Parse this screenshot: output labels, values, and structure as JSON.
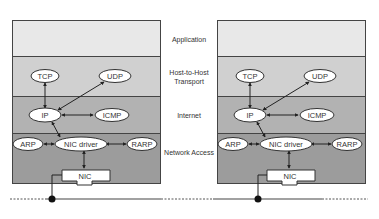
{
  "layers": {
    "application": "Application",
    "transport_line1": "Host-to-Host",
    "transport_line2": "Transport",
    "internet": "Internet",
    "network_access": "Network Access"
  },
  "stacks": [
    {
      "nodes": {
        "tcp": "TCP",
        "udp": "UDP",
        "ip": "IP",
        "icmp": "ICMP",
        "arp": "ARP",
        "nic_driver": "NIC driver",
        "rarp": "RARP",
        "nic": "NIC"
      }
    },
    {
      "nodes": {
        "tcp": "TCP",
        "udp": "UDP",
        "ip": "IP",
        "icmp": "ICMP",
        "arp": "ARP",
        "nic_driver": "NIC driver",
        "rarp": "RARP",
        "nic": "NIC"
      }
    }
  ],
  "colors": {
    "application": "#e8e8e8",
    "transport": "#d0d0d0",
    "internet": "#b2b2b2",
    "network_access": "#9c9c9c",
    "border": "#444444"
  }
}
